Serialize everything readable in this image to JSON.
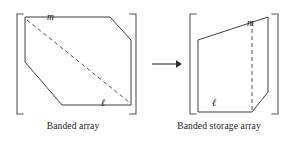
{
  "figure": {
    "background_color": "#ffffff",
    "stroke_color": "#3a3a3a",
    "bracket_color": "#555555",
    "text_color": "#1a1a1a",
    "width": 292,
    "height": 143
  },
  "left_panel": {
    "caption": "Banded array",
    "labels": {
      "m": "m",
      "l": "ℓ"
    },
    "shape_name": "banded-array-polygon",
    "has_dashed_diagonal": true,
    "bracket_left_x": 17,
    "bracket_right_x": 136
  },
  "right_panel": {
    "caption": "Banded storage array",
    "labels": {
      "m": "m",
      "l": "ℓ"
    },
    "shape_name": "banded-storage-array-polygon",
    "has_dashed_vertical": true,
    "bracket_left_x": 44,
    "bracket_right_x": 132
  },
  "arrow": {
    "name": "transform-arrow",
    "direction": "right",
    "x_start": 152,
    "x_end": 180,
    "y": 64
  }
}
